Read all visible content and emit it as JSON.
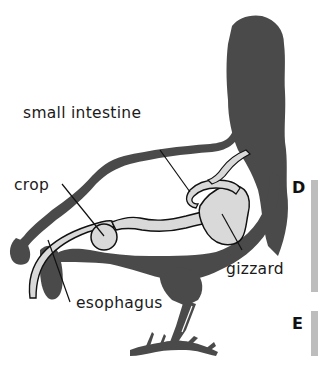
{
  "diagram": {
    "labels": {
      "small_intestine": "small intestine",
      "crop": "crop",
      "gizzard": "gizzard",
      "esophagus": "esophagus"
    },
    "markers": {
      "d": "D",
      "e": "E"
    },
    "colors": {
      "silhouette": "#4a4a4a",
      "organ_fill": "#d9d9d9",
      "outline": "#111111",
      "bar": "#bdbdbd",
      "background": "#ffffff"
    }
  }
}
